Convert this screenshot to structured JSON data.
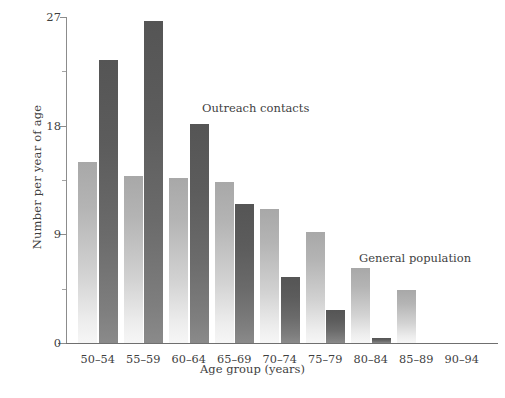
{
  "chart_data": {
    "type": "bar",
    "title": "",
    "xlabel": "Age group (years)",
    "ylabel": "Number per year of age",
    "categories": [
      "50–54",
      "55–59",
      "60–64",
      "65–69",
      "70–74",
      "75–79",
      "80–84",
      "85–89",
      "90–94"
    ],
    "series": [
      {
        "name": "General population",
        "color": "#c0c0c0",
        "values": [
          15.0,
          13.8,
          13.7,
          13.3,
          11.1,
          9.2,
          6.2,
          4.4,
          0
        ]
      },
      {
        "name": "Outreach contacts",
        "color": "#646464",
        "values": [
          23.4,
          26.7,
          18.1,
          11.5,
          5.5,
          2.7,
          0.4,
          0,
          0
        ]
      }
    ],
    "ylim": [
      0,
      27
    ],
    "yticks_major": [
      0,
      9,
      18,
      27
    ],
    "yticks_major_labels": [
      "0",
      "9",
      "18",
      "27"
    ],
    "yticks_minor": [
      4.5,
      13.5,
      22.5
    ],
    "grid": false,
    "legend_position": "inline-annotations",
    "annotations": [
      {
        "text": "Outreach contacts",
        "name": "annotation-outreach-contacts"
      },
      {
        "text": "General population",
        "name": "annotation-general-population"
      }
    ]
  }
}
